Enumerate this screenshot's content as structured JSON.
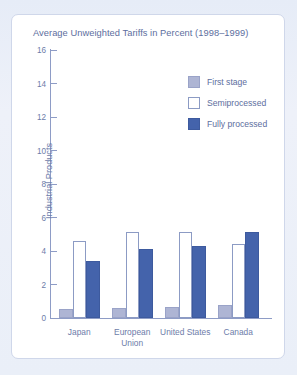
{
  "figure": {
    "title": "Average Unweighted Tariffs in Percent (1998–1999)",
    "frame_color": "#cfd7ea",
    "background_color": "#eaeff8",
    "text_color": "#5d6e9e"
  },
  "legend": {
    "position": "top-right",
    "entries": [
      {
        "label": "First stage",
        "color": "#aeb5d4",
        "swatch": "first"
      },
      {
        "label": "Semiprocessed",
        "color": "#ffffff",
        "swatch": "semi"
      },
      {
        "label": "Fully processed",
        "color": "#4463ab",
        "swatch": "fully"
      }
    ]
  },
  "axes": {
    "y_title": "Industrial Products",
    "y_ticks": [
      "0",
      "2",
      "4",
      "6",
      "8",
      "10",
      "12",
      "14",
      "16"
    ],
    "x_categories": [
      "Japan",
      "European Union",
      "United States",
      "Canada"
    ]
  },
  "chart_data": {
    "type": "bar",
    "title": "Average Unweighted Tariffs in Percent (1998–1999)",
    "xlabel": "",
    "ylabel": "Industrial Products",
    "ylim": [
      0,
      16
    ],
    "ytick_step": 2,
    "grid": false,
    "legend_position": "top-right",
    "categories": [
      "Japan",
      "European Union",
      "United States",
      "Canada"
    ],
    "series": [
      {
        "name": "First stage",
        "color": "#aeb5d4",
        "values": [
          0.5,
          0.6,
          0.65,
          0.75
        ]
      },
      {
        "name": "Semiprocessed",
        "color": "#ffffff",
        "values": [
          4.6,
          5.1,
          5.1,
          4.4
        ]
      },
      {
        "name": "Fully processed",
        "color": "#4463ab",
        "values": [
          3.4,
          4.1,
          4.25,
          5.1
        ]
      }
    ]
  }
}
